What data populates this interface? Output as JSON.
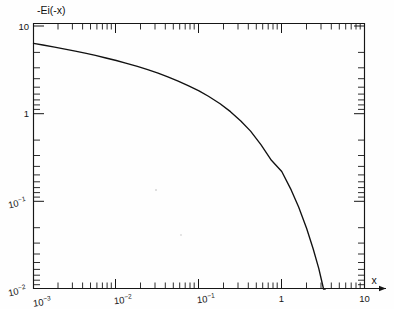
{
  "figure": {
    "background_color": "#fefefe",
    "line_color": "#111111",
    "curve_label": "-Ei(-x)",
    "x_axis_title": "x"
  },
  "chart_data": {
    "type": "line",
    "title": "",
    "subtitle": "",
    "xlabel": "x",
    "ylabel": "-Ei(-x)",
    "xscale": "log",
    "yscale": "log",
    "xlim": [
      0.001,
      10
    ],
    "ylim": [
      0.01,
      10
    ],
    "grid": false,
    "legend": "none",
    "x_tick_labels": [
      "10-3",
      "10-2",
      "10-1",
      "1",
      "10"
    ],
    "x_tick_values": [
      0.001,
      0.01,
      0.1,
      1,
      10
    ],
    "y_tick_labels": [
      "10",
      "1",
      "10-1",
      "10-2"
    ],
    "y_tick_values": [
      10,
      1,
      0.1,
      0.01
    ],
    "minor_ticks": true,
    "series": [
      {
        "name": "-Ei(-x)",
        "x": [
          0.001,
          0.0013,
          0.0018,
          0.0024,
          0.0032,
          0.0042,
          0.0056,
          0.0075,
          0.01,
          0.013,
          0.018,
          0.024,
          0.032,
          0.042,
          0.056,
          0.075,
          0.1,
          0.13,
          0.18,
          0.24,
          0.32,
          0.42,
          0.56,
          0.75,
          1.0,
          1.3,
          1.6,
          2.0,
          2.4,
          2.8,
          3.0,
          3.2,
          3.35
        ],
        "y": [
          6.331,
          6.069,
          5.745,
          5.459,
          5.173,
          4.901,
          4.615,
          4.318,
          4.038,
          3.779,
          3.455,
          3.172,
          2.892,
          2.629,
          2.356,
          2.075,
          1.823,
          1.581,
          1.299,
          1.055,
          0.826,
          0.632,
          0.444,
          0.294,
          0.219,
          0.135,
          0.0863,
          0.0489,
          0.0286,
          0.0172,
          0.013,
          0.01,
          0.01
        ]
      }
    ],
    "annotations": [
      {
        "text": "-Ei(-x)",
        "position": "top-left-inside"
      },
      {
        "text": "x",
        "position": "bottom-right-outside"
      }
    ]
  }
}
